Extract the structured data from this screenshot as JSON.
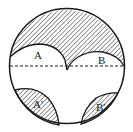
{
  "diagram": {
    "type": "geometry",
    "labels": {
      "a": "A",
      "b": "B",
      "a_prime": "A'",
      "b_prime": "B'"
    },
    "colors": {
      "stroke": "#1a1a1a",
      "hatch": "#1a1a1a",
      "background": "#ffffff"
    },
    "dashed_line": "diameter"
  }
}
